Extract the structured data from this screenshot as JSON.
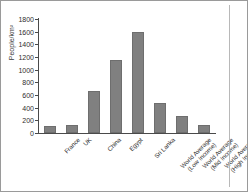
{
  "figure": {
    "source_note": "Source: World Development Indicators 2001"
  },
  "chart_data": {
    "type": "bar",
    "title": "",
    "xlabel": "",
    "ylabel": "People/km²",
    "ylim": [
      0,
      1800
    ],
    "ytick_values": [
      0,
      200,
      400,
      600,
      800,
      1000,
      1200,
      1400,
      1600,
      1800
    ],
    "ytick_labels": [
      "0",
      "200",
      "400",
      "600",
      "800",
      "1000",
      "1200",
      "1400",
      "1600",
      "1800"
    ],
    "grid": false,
    "legend": "none",
    "bar_color": "#808080",
    "categories": [
      "France",
      "UK",
      "China",
      "Egypt",
      "Sri Lanka",
      "World Average (Low Income)",
      "World Average (Mid Income)",
      "World Average (High Income)"
    ],
    "category_lines": [
      [
        "France",
        ""
      ],
      [
        "UK",
        ""
      ],
      [
        "China",
        ""
      ],
      [
        "Egypt",
        ""
      ],
      [
        "Sri Lanka",
        ""
      ],
      [
        "World Average",
        "(Low Income)"
      ],
      [
        "World Average",
        "(Mid Income)"
      ],
      [
        "World Average",
        "(High Income)"
      ]
    ],
    "values": [
      110,
      125,
      660,
      1150,
      1600,
      470,
      270,
      130
    ]
  }
}
